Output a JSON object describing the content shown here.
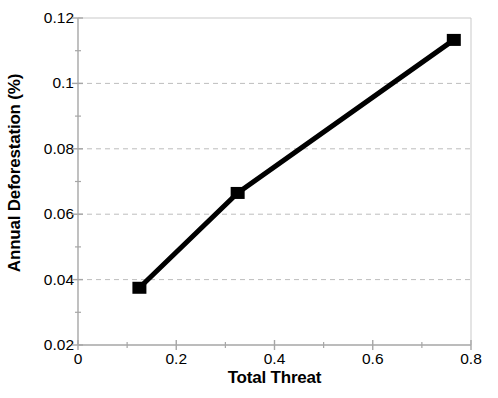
{
  "chart_data": {
    "type": "line",
    "title": "",
    "xlabel": "Total Threat",
    "ylabel": "Annual Deforestation (%)",
    "xlim": [
      0,
      0.8
    ],
    "ylim": [
      0.02,
      0.12
    ],
    "grid": "horizontal-dashed",
    "legend": "none",
    "x": [
      0.125,
      0.325,
      0.765
    ],
    "values": [
      0.0375,
      0.0665,
      0.1133
    ],
    "series": [
      {
        "name": "Annual Deforestation",
        "x": [
          0.125,
          0.325,
          0.765
        ],
        "values": [
          0.0375,
          0.0665,
          0.1133
        ],
        "marker": "filled-square",
        "marker_color": "#000000",
        "line_color": "#000000",
        "line_width": 5
      }
    ],
    "xticks": [
      0,
      0.2,
      0.4,
      0.6,
      0.8
    ],
    "xtick_labels": [
      "0",
      "0.2",
      "0.4",
      "0.6",
      "0.8"
    ],
    "x_minor_ticks": [
      0.1,
      0.3,
      0.5,
      0.7
    ],
    "yticks": [
      0.02,
      0.04,
      0.06,
      0.08,
      0.1,
      0.12
    ],
    "ytick_labels": [
      "0.02",
      "0.04",
      "0.06",
      "0.08",
      "0.1",
      "0.12"
    ],
    "y_minor_ticks": [
      0.03,
      0.05,
      0.07,
      0.09,
      0.11
    ],
    "gridline_values": [
      0.04,
      0.06,
      0.08,
      0.1
    ],
    "colors": {
      "background": "#ffffff",
      "axis": "#a6a6a6",
      "gridline": "#bdbdbd",
      "data": "#000000",
      "text": "#000000"
    }
  },
  "axis_titles": {
    "x": "Total Threat",
    "y": "Annual Deforestation (%)"
  }
}
